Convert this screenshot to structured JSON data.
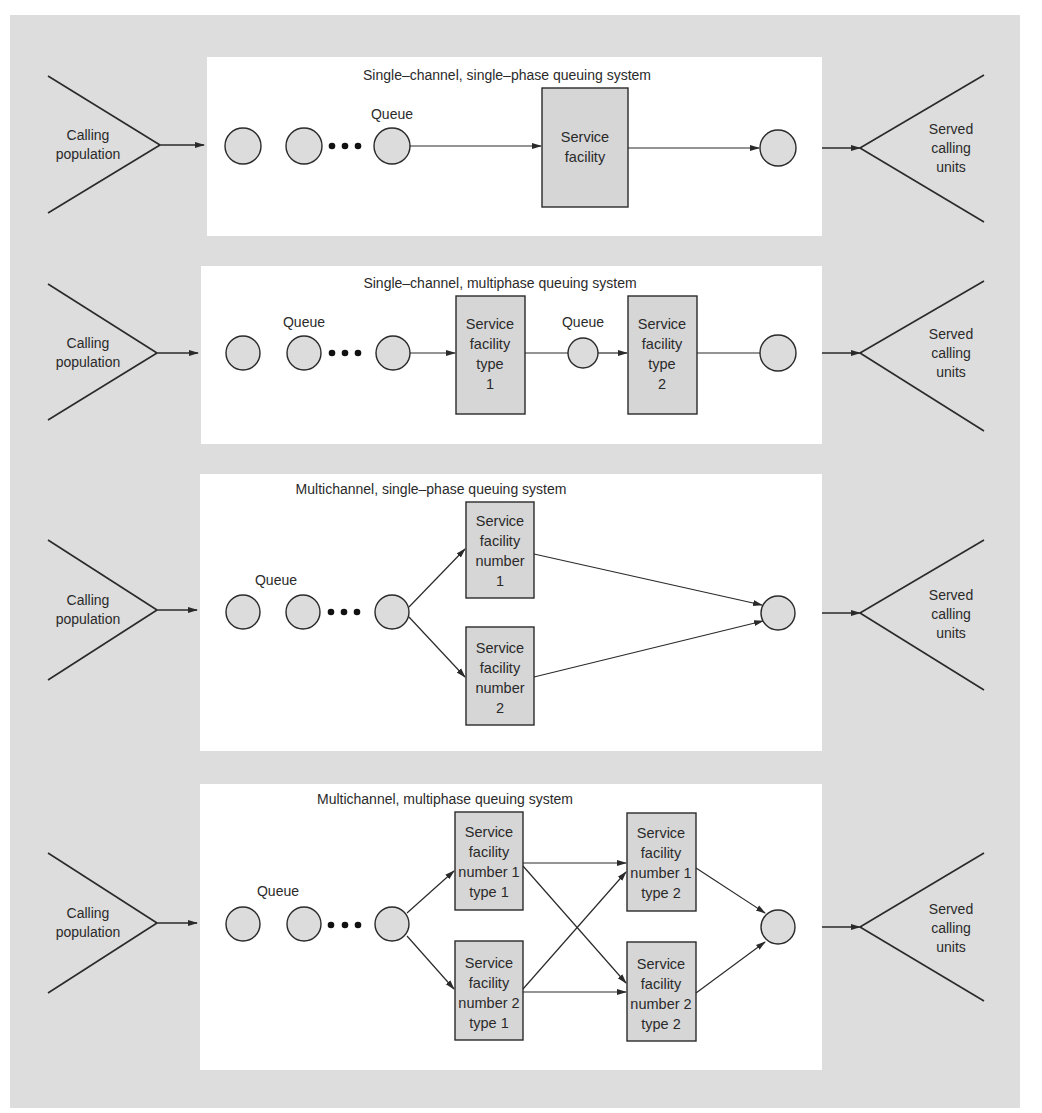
{
  "colors": {
    "background": "#dddddd",
    "panel": "#ffffff",
    "node_fill": "#dcdcdc",
    "box_fill": "#d6d6d6",
    "stroke": "#2a2a2a"
  },
  "common": {
    "source_label": [
      "Calling",
      "population"
    ],
    "sink_label": [
      "Served",
      "calling",
      "units"
    ],
    "queue_label": "Queue"
  },
  "systems": [
    {
      "id": "single-channel-single-phase",
      "title": "Single–channel, single–phase queuing system",
      "facilities": [
        {
          "label": [
            "Service",
            "facility"
          ]
        }
      ]
    },
    {
      "id": "single-channel-multiphase",
      "title": "Single–channel, multiphase queuing system",
      "facilities": [
        {
          "label": [
            "Service",
            "facility",
            "type",
            "1"
          ]
        },
        {
          "label": [
            "Service",
            "facility",
            "type",
            "2"
          ]
        }
      ],
      "intermediate_queue_label": "Queue"
    },
    {
      "id": "multichannel-single-phase",
      "title": "Multichannel, single–phase queuing system",
      "facilities": [
        {
          "label": [
            "Service",
            "facility",
            "number",
            "1"
          ]
        },
        {
          "label": [
            "Service",
            "facility",
            "number",
            "2"
          ]
        }
      ]
    },
    {
      "id": "multichannel-multiphase",
      "title": "Multichannel, multiphase queuing system",
      "facilities": [
        {
          "label": [
            "Service",
            "facility",
            "number 1",
            "type 1"
          ]
        },
        {
          "label": [
            "Service",
            "facility",
            "number 2",
            "type 1"
          ]
        },
        {
          "label": [
            "Service",
            "facility",
            "number 1",
            "type 2"
          ]
        },
        {
          "label": [
            "Service",
            "facility",
            "number 2",
            "type 2"
          ]
        }
      ]
    }
  ]
}
